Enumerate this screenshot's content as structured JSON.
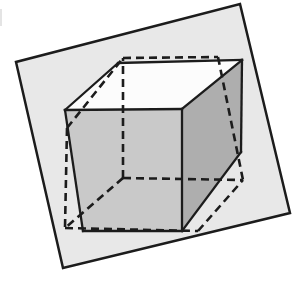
{
  "figure": {
    "canvas": {
      "width": 300,
      "height": 281
    },
    "colors": {
      "background": "#ffffff",
      "plane_fill": "#e8e8e8",
      "front_face": "#c9c9c9",
      "right_face": "#aeaeae",
      "top_face": "#fcfcfc",
      "line": "#1c1c1c"
    },
    "plane": {
      "points": "240,4 290,213 63,268 16,62"
    },
    "solid_cube": {
      "faces": {
        "front": "65,110 182,109 182,231 83,231",
        "top": "65,110 118,63 242,60 182,109",
        "right": "182,109 242,60 241,152 182,231"
      },
      "edges": [
        {
          "name": "left-upper",
          "points": "65,110 118,63"
        },
        {
          "name": "top-back",
          "points": "118,63 242,60"
        },
        {
          "name": "right-back",
          "points": "242,60 241,152"
        },
        {
          "name": "right-lower",
          "points": "241,152 182,231"
        },
        {
          "name": "bottom",
          "points": "182,231 83,231"
        },
        {
          "name": "left",
          "points": "83,231 65,110"
        },
        {
          "name": "front-top",
          "points": "65,110 182,109"
        },
        {
          "name": "front-right",
          "points": "182,109 182,231"
        },
        {
          "name": "top-right",
          "points": "182,109 242,60"
        }
      ]
    },
    "dashed_cube": {
      "edges": [
        {
          "name": "top-back",
          "points": "123,58 218,57"
        },
        {
          "name": "left-upper",
          "points": "67,128 123,58"
        },
        {
          "name": "left",
          "points": "67,128 65,228"
        },
        {
          "name": "bottom",
          "points": "65,228 198,231"
        },
        {
          "name": "right-lower",
          "points": "198,231 243,180"
        },
        {
          "name": "right-upper",
          "points": "218,57 243,180"
        },
        {
          "name": "hidden-vertical",
          "points": "123,178 123,58"
        },
        {
          "name": "hidden-horizontal",
          "points": "123,178 243,180"
        },
        {
          "name": "hidden-diagonal",
          "points": "123,178 65,228"
        }
      ]
    }
  }
}
